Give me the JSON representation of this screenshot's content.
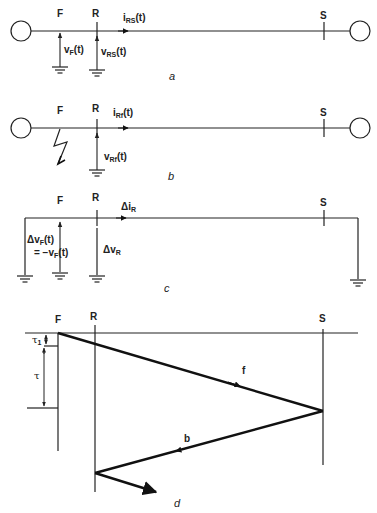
{
  "panel_a": {
    "caption": "a",
    "node_F": "F",
    "node_R": "R",
    "node_S": "S",
    "current_main": "i",
    "current_sub": "RS",
    "current_tail": "(t)",
    "vF_main": "v",
    "vF_sub": "F",
    "vF_tail": "(t)",
    "vRS_main": "v",
    "vRS_sub": "RS",
    "vRS_tail": "(t)"
  },
  "panel_b": {
    "caption": "b",
    "node_F": "F",
    "node_R": "R",
    "node_S": "S",
    "current_main": "i",
    "current_sub": "Rf",
    "current_tail": "(t)",
    "vRf_main": "v",
    "vRf_sub": "Rf",
    "vRf_tail": "(t)"
  },
  "panel_c": {
    "caption": "c",
    "node_F": "F",
    "node_R": "R",
    "node_S": "S",
    "current_main": "Δi",
    "current_sub": "R",
    "dvF_main": "Δv",
    "dvF_sub": "F",
    "dvF_tail": "(t)",
    "dvF_eq_main": "= −v",
    "dvF_eq_sub": "F",
    "dvF_eq_tail": "(t)",
    "dvR_main": "Δv",
    "dvR_sub": "R"
  },
  "panel_d": {
    "caption": "d",
    "node_F": "F",
    "node_R": "R",
    "node_S": "S",
    "tau1_main": "τ",
    "tau1_sub": "1",
    "tau": "τ",
    "forward_wave": "f",
    "backward_wave": "b"
  }
}
